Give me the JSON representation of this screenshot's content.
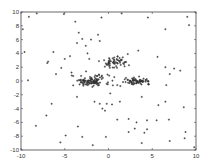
{
  "chart_data": {
    "type": "scatter",
    "title": "",
    "xlabel": "",
    "ylabel": "",
    "xlim": [
      -10,
      10
    ],
    "ylim": [
      -10,
      10
    ],
    "xticks": [
      -10,
      -5,
      0,
      5,
      10
    ],
    "yticks": [
      -10,
      -8,
      -6,
      -4,
      -2,
      0,
      2,
      4,
      6,
      8,
      10
    ],
    "grid": false,
    "legend": null,
    "marker": "+",
    "marker_color": "#333333",
    "series": [
      {
        "name": "noise",
        "points": [
          [
            -9.1,
            9.3
          ],
          [
            -8.2,
            9.8
          ],
          [
            -5.1,
            9.7
          ],
          [
            -3.8,
            8.6
          ],
          [
            -0.8,
            9.2
          ],
          [
            1.5,
            9.8
          ],
          [
            4.5,
            9.2
          ],
          [
            6.5,
            7.5
          ],
          [
            9.0,
            9.3
          ],
          [
            9.2,
            8.1
          ],
          [
            -9.8,
            7.5
          ],
          [
            -3.4,
            7.0
          ],
          [
            -3.0,
            6.1
          ],
          [
            -3.6,
            5.5
          ],
          [
            -2.6,
            5.1
          ],
          [
            -2.0,
            6.0
          ],
          [
            -1.2,
            6.7
          ],
          [
            -1.0,
            5.8
          ],
          [
            -2.4,
            4.0
          ],
          [
            -2.2,
            3.2
          ],
          [
            -4.4,
            3.6
          ],
          [
            -7.0,
            2.6
          ],
          [
            -6.9,
            2.8
          ],
          [
            -5.0,
            3.2
          ],
          [
            -9.6,
            4.2
          ],
          [
            -6.3,
            4.2
          ],
          [
            -5.4,
            1.9
          ],
          [
            -4.2,
            0.8
          ],
          [
            2.2,
            3.9
          ],
          [
            3.4,
            4.4
          ],
          [
            5.6,
            3.5
          ],
          [
            6.5,
            2.0
          ],
          [
            7.5,
            1.8
          ],
          [
            7.0,
            1.0
          ],
          [
            8.2,
            1.5
          ],
          [
            -9.2,
            0.1
          ],
          [
            -6.5,
            -3.3
          ],
          [
            -7.1,
            -5.0
          ],
          [
            -8.3,
            -6.5
          ],
          [
            -3.6,
            -2.3
          ],
          [
            -3.5,
            -6.6
          ],
          [
            -1.6,
            -3.0
          ],
          [
            -1.0,
            -3.3
          ],
          [
            -0.7,
            -4.0
          ],
          [
            0.2,
            -1.8
          ],
          [
            1.0,
            -0.6
          ],
          [
            -0.4,
            -4.3
          ],
          [
            -5.5,
            -8.9
          ],
          [
            -3.0,
            -8.1
          ],
          [
            -4.9,
            -7.9
          ],
          [
            -0.3,
            -8.1
          ],
          [
            1.3,
            -3.0
          ],
          [
            0.4,
            -3.4
          ],
          [
            -0.2,
            -3.3
          ],
          [
            3.8,
            -2.3
          ],
          [
            5.7,
            -3.5
          ],
          [
            6.5,
            -3.0
          ],
          [
            8.6,
            -3.8
          ],
          [
            1.0,
            -5.6
          ],
          [
            2.3,
            -5.5
          ],
          [
            3.2,
            -6.0
          ],
          [
            4.4,
            -5.7
          ],
          [
            5.5,
            -5.7
          ],
          [
            6.9,
            -5.6
          ],
          [
            2.3,
            -7.4
          ],
          [
            3.0,
            -6.9
          ],
          [
            4.1,
            -7.5
          ],
          [
            4.4,
            -7.0
          ],
          [
            3.8,
            -9.0
          ],
          [
            7.0,
            -8.7
          ],
          [
            8.8,
            -7.4
          ],
          [
            8.7,
            -8.3
          ],
          [
            9.8,
            -9.6
          ],
          [
            -1.8,
            -9.3
          ],
          [
            6.6,
            -0.6
          ],
          [
            -6.0,
            1.0
          ]
        ]
      },
      {
        "name": "cluster_left",
        "center": [
          -2.0,
          0.0
        ],
        "spread": [
          1.8,
          0.7
        ],
        "count": 110
      },
      {
        "name": "cluster_upper",
        "center": [
          0.8,
          2.7
        ],
        "spread": [
          1.4,
          0.8
        ],
        "count": 60
      },
      {
        "name": "cluster_right",
        "center": [
          3.3,
          0.0
        ],
        "spread": [
          1.2,
          0.35
        ],
        "count": 70
      }
    ]
  }
}
